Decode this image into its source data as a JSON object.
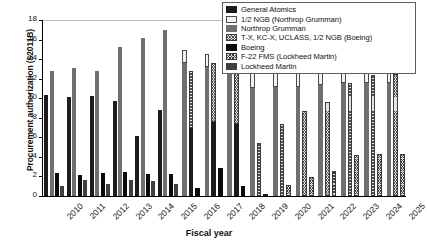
{
  "chart_data": {
    "type": "bar",
    "title": "",
    "xlabel": "Fiscal year",
    "ylabel": "Procurement authorization ($2011B)",
    "ylim": [
      0,
      18
    ],
    "yticks": [
      0,
      2,
      4,
      6,
      8,
      10,
      12,
      14,
      16,
      18
    ],
    "grid": false,
    "legend_position": "top-right",
    "categories": [
      "2010",
      "2011",
      "2012",
      "2013",
      "2014",
      "2015",
      "2016",
      "2017",
      "2018",
      "2019",
      "2020",
      "2021",
      "2022",
      "2023",
      "2024",
      "2025"
    ],
    "series": [
      {
        "name": "General Atomics",
        "key": "general_atomics",
        "fill": "solid-dark",
        "values": [
          10.3,
          10.1,
          10.2,
          9.7,
          6.1,
          8.8,
          7.0,
          7.6,
          7.4,
          0.2,
          0.0,
          0.0,
          0.0,
          0.0,
          0.0,
          0.0
        ]
      },
      {
        "name": "1/2 NGB (Northrop Grumman)",
        "key": "half_ngb_northrop",
        "fill": "dotted-light",
        "values": [
          0.0,
          0.0,
          0.0,
          0.0,
          0.0,
          0.0,
          1.3,
          1.3,
          1.4,
          1.6,
          1.7,
          1.7,
          1.7,
          1.7,
          1.6,
          1.6
        ]
      },
      {
        "name": "Northrop Grumman",
        "key": "northrop_grumman",
        "fill": "solid-gray",
        "values": [
          12.8,
          13.1,
          12.8,
          15.2,
          16.2,
          17.0,
          13.6,
          13.2,
          12.9,
          11.0,
          11.1,
          11.2,
          11.4,
          11.6,
          11.6,
          11.6
        ]
      },
      {
        "name": "T-X, KC-X, UCLASS, 1/2 NGB (Boeing)",
        "key": "boeing_programs",
        "fill": "crosshatch-light",
        "values": [
          0.0,
          0.0,
          0.0,
          0.0,
          0.0,
          0.0,
          5.8,
          6.0,
          5.8,
          5.4,
          7.4,
          8.7,
          9.6,
          11.6,
          12.4,
          12.5
        ]
      },
      {
        "name": "Boeing",
        "key": "boeing",
        "fill": "solid-black",
        "values": [
          2.4,
          2.1,
          2.4,
          2.5,
          2.3,
          2.3,
          0.8,
          2.9,
          1.0,
          0.0,
          0.0,
          0.0,
          0.0,
          0.0,
          0.0,
          0.0
        ]
      },
      {
        "name": "F-22 FMS (Lockheed Martin)",
        "key": "f22_fms_lockheed",
        "fill": "hatch-light",
        "values": [
          0.0,
          0.0,
          0.0,
          0.0,
          0.0,
          0.0,
          0.0,
          0.0,
          0.0,
          0.0,
          1.1,
          1.9,
          2.6,
          4.2,
          4.3,
          4.3
        ]
      },
      {
        "name": "Lockheed Martin",
        "key": "lockheed_martin",
        "fill": "solid-darkgray",
        "values": [
          1.0,
          1.6,
          1.2,
          1.6,
          1.5,
          1.2,
          0.0,
          0.0,
          0.0,
          0.0,
          0.0,
          0.0,
          0.0,
          0.0,
          0.0,
          0.0
        ]
      }
    ],
    "stacks": {
      "note": "Bars 2016-2025 are two-segment stacks: a solid lower segment with a patterned upper segment.",
      "column_stacks": [
        {
          "year": "2016",
          "bars": [
            {
              "segments": [
                {
                  "series": "Northrop Grumman",
                  "value": 13.6
                },
                {
                  "series": "1/2 NGB (Northrop Grumman)",
                  "value": 1.3
                }
              ]
            },
            {
              "segments": [
                {
                  "series": "General Atomics",
                  "value": 7.0
                },
                {
                  "series": "T-X, KC-X, UCLASS, 1/2 NGB (Boeing)",
                  "value": 5.8
                }
              ]
            },
            {
              "segments": [
                {
                  "series": "Boeing",
                  "value": 0.8
                }
              ]
            }
          ]
        },
        {
          "year": "2017",
          "bars": [
            {
              "segments": [
                {
                  "series": "Northrop Grumman",
                  "value": 13.2
                },
                {
                  "series": "1/2 NGB (Northrop Grumman)",
                  "value": 1.3
                }
              ]
            },
            {
              "segments": [
                {
                  "series": "General Atomics",
                  "value": 7.6
                },
                {
                  "series": "T-X, KC-X, UCLASS, 1/2 NGB (Boeing)",
                  "value": 6.0
                }
              ]
            },
            {
              "segments": [
                {
                  "series": "Boeing",
                  "value": 2.9
                }
              ]
            }
          ]
        },
        {
          "year": "2018",
          "bars": [
            {
              "segments": [
                {
                  "series": "Northrop Grumman",
                  "value": 12.9
                },
                {
                  "series": "1/2 NGB (Northrop Grumman)",
                  "value": 1.4
                }
              ]
            },
            {
              "segments": [
                {
                  "series": "General Atomics",
                  "value": 7.4
                },
                {
                  "series": "T-X, KC-X, UCLASS, 1/2 NGB (Boeing)",
                  "value": 5.8
                }
              ]
            },
            {
              "segments": [
                {
                  "series": "Boeing",
                  "value": 1.0
                }
              ]
            }
          ]
        },
        {
          "year": "2019",
          "bars": [
            {
              "segments": [
                {
                  "series": "Northrop Grumman",
                  "value": 11.0
                },
                {
                  "series": "1/2 NGB (Northrop Grumman)",
                  "value": 1.6
                }
              ]
            },
            {
              "segments": [
                {
                  "series": "T-X, KC-X, UCLASS, 1/2 NGB (Boeing)",
                  "value": 5.4
                }
              ]
            },
            {
              "segments": [
                {
                  "series": "General Atomics",
                  "value": 0.2
                }
              ]
            }
          ]
        },
        {
          "year": "2020",
          "bars": [
            {
              "segments": [
                {
                  "series": "Northrop Grumman",
                  "value": 11.1
                },
                {
                  "series": "1/2 NGB (Northrop Grumman)",
                  "value": 1.7
                }
              ]
            },
            {
              "segments": [
                {
                  "series": "T-X, KC-X, UCLASS, 1/2 NGB (Boeing)",
                  "value": 7.4
                }
              ]
            },
            {
              "segments": [
                {
                  "series": "F-22 FMS (Lockheed Martin)",
                  "value": 1.1
                }
              ]
            }
          ]
        },
        {
          "year": "2021",
          "bars": [
            {
              "segments": [
                {
                  "series": "Northrop Grumman",
                  "value": 11.2
                },
                {
                  "series": "1/2 NGB (Northrop Grumman)",
                  "value": 1.7
                }
              ]
            },
            {
              "segments": [
                {
                  "series": "T-X, KC-X, UCLASS, 1/2 NGB (Boeing)",
                  "value": 8.7
                }
              ]
            },
            {
              "segments": [
                {
                  "series": "F-22 FMS (Lockheed Martin)",
                  "value": 1.9
                }
              ]
            }
          ]
        },
        {
          "year": "2022",
          "bars": [
            {
              "segments": [
                {
                  "series": "Northrop Grumman",
                  "value": 11.4
                },
                {
                  "series": "1/2 NGB (Northrop Grumman)",
                  "value": 1.7
                }
              ]
            },
            {
              "segments": [
                {
                  "series": "T-X, KC-X, UCLASS, 1/2 NGB (Boeing)",
                  "value": 9.6
                }
              ]
            },
            {
              "segments": [
                {
                  "series": "F-22 FMS (Lockheed Martin)",
                  "value": 2.6
                }
              ]
            }
          ]
        },
        {
          "year": "2023",
          "bars": [
            {
              "segments": [
                {
                  "series": "Northrop Grumman",
                  "value": 11.6
                },
                {
                  "series": "1/2 NGB (Northrop Grumman)",
                  "value": 1.7
                }
              ]
            },
            {
              "segments": [
                {
                  "series": "T-X, KC-X, UCLASS, 1/2 NGB (Boeing)",
                  "value": 11.6
                }
              ]
            },
            {
              "segments": [
                {
                  "series": "F-22 FMS (Lockheed Martin)",
                  "value": 4.2
                }
              ]
            }
          ]
        },
        {
          "year": "2024",
          "bars": [
            {
              "segments": [
                {
                  "series": "Northrop Grumman",
                  "value": 11.6
                },
                {
                  "series": "1/2 NGB (Northrop Grumman)",
                  "value": 1.6
                }
              ]
            },
            {
              "segments": [
                {
                  "series": "T-X, KC-X, UCLASS, 1/2 NGB (Boeing)",
                  "value": 12.4
                }
              ]
            },
            {
              "segments": [
                {
                  "series": "F-22 FMS (Lockheed Martin)",
                  "value": 4.3
                }
              ]
            }
          ]
        },
        {
          "year": "2025",
          "bars": [
            {
              "segments": [
                {
                  "series": "Northrop Grumman",
                  "value": 11.6
                },
                {
                  "series": "1/2 NGB (Northrop Grumman)",
                  "value": 1.6
                }
              ]
            },
            {
              "segments": [
                {
                  "series": "T-X, KC-X, UCLASS, 1/2 NGB (Boeing)",
                  "value": 12.5
                }
              ]
            },
            {
              "segments": [
                {
                  "series": "F-22 FMS (Lockheed Martin)",
                  "value": 4.3
                }
              ]
            }
          ]
        }
      ]
    },
    "columns": [
      {
        "year": "2010",
        "bars": [
          [
            {
              "s": 0,
              "v": 10.3
            }
          ],
          [
            {
              "s": 2,
              "v": 12.8
            }
          ],
          [
            {
              "s": 4,
              "v": 2.4
            }
          ],
          [
            {
              "s": 6,
              "v": 1.0
            }
          ]
        ]
      },
      {
        "year": "2011",
        "bars": [
          [
            {
              "s": 0,
              "v": 10.1
            }
          ],
          [
            {
              "s": 2,
              "v": 13.1
            }
          ],
          [
            {
              "s": 4,
              "v": 2.1
            }
          ],
          [
            {
              "s": 6,
              "v": 1.6
            }
          ]
        ]
      },
      {
        "year": "2012",
        "bars": [
          [
            {
              "s": 0,
              "v": 10.2
            }
          ],
          [
            {
              "s": 2,
              "v": 12.8
            }
          ],
          [
            {
              "s": 4,
              "v": 2.4
            }
          ],
          [
            {
              "s": 6,
              "v": 1.2
            }
          ]
        ]
      },
      {
        "year": "2013",
        "bars": [
          [
            {
              "s": 0,
              "v": 9.7
            }
          ],
          [
            {
              "s": 2,
              "v": 15.2
            }
          ],
          [
            {
              "s": 4,
              "v": 2.5
            }
          ],
          [
            {
              "s": 6,
              "v": 1.6
            }
          ]
        ]
      },
      {
        "year": "2014",
        "bars": [
          [
            {
              "s": 0,
              "v": 6.1
            }
          ],
          [
            {
              "s": 2,
              "v": 16.2
            }
          ],
          [
            {
              "s": 4,
              "v": 2.3
            }
          ],
          [
            {
              "s": 6,
              "v": 1.5
            }
          ]
        ]
      },
      {
        "year": "2015",
        "bars": [
          [
            {
              "s": 0,
              "v": 8.8
            }
          ],
          [
            {
              "s": 2,
              "v": 17.0
            }
          ],
          [
            {
              "s": 4,
              "v": 2.3
            }
          ],
          [
            {
              "s": 6,
              "v": 1.2
            }
          ]
        ]
      },
      {
        "year": "2016",
        "bars": [
          [
            {
              "s": 2,
              "v": 13.6
            },
            {
              "s": 1,
              "v": 1.3
            }
          ],
          [
            {
              "s": 0,
              "v": 7.0
            },
            {
              "s": 3,
              "v": 5.8
            }
          ],
          [
            {
              "s": 4,
              "v": 0.8
            }
          ]
        ]
      },
      {
        "year": "2017",
        "bars": [
          [
            {
              "s": 2,
              "v": 13.2
            },
            {
              "s": 1,
              "v": 1.3
            }
          ],
          [
            {
              "s": 0,
              "v": 7.6
            },
            {
              "s": 3,
              "v": 6.0
            }
          ],
          [
            {
              "s": 4,
              "v": 2.9
            }
          ]
        ]
      },
      {
        "year": "2018",
        "bars": [
          [
            {
              "s": 2,
              "v": 12.9
            },
            {
              "s": 1,
              "v": 1.4
            }
          ],
          [
            {
              "s": 0,
              "v": 7.4
            },
            {
              "s": 3,
              "v": 5.8
            }
          ],
          [
            {
              "s": 4,
              "v": 1.0
            }
          ]
        ]
      },
      {
        "year": "2019",
        "bars": [
          [
            {
              "s": 2,
              "v": 11.0
            },
            {
              "s": 1,
              "v": 1.6
            }
          ],
          [
            {
              "s": 3,
              "v": 5.4
            }
          ],
          [
            {
              "s": 0,
              "v": 0.2
            }
          ]
        ]
      },
      {
        "year": "2020",
        "bars": [
          [
            {
              "s": 2,
              "v": 11.1
            },
            {
              "s": 1,
              "v": 1.7
            }
          ],
          [
            {
              "s": 3,
              "v": 7.4
            }
          ],
          [
            {
              "s": 5,
              "v": 1.1
            }
          ]
        ]
      },
      {
        "year": "2021",
        "bars": [
          [
            {
              "s": 2,
              "v": 11.2
            },
            {
              "s": 1,
              "v": 1.7
            }
          ],
          [
            {
              "s": 3,
              "v": 8.7
            }
          ],
          [
            {
              "s": 5,
              "v": 1.9
            }
          ]
        ]
      },
      {
        "year": "2022",
        "bars": [
          [
            {
              "s": 2,
              "v": 11.4
            },
            {
              "s": 1,
              "v": 1.7
            }
          ],
          [
            {
              "s": 3,
              "v": 9.6
            }
          ],
          [
            {
              "s": 5,
              "v": 2.6
            }
          ]
        ]
      },
      {
        "year": "2023",
        "bars": [
          [
            {
              "s": 2,
              "v": 11.6
            },
            {
              "s": 1,
              "v": 1.7
            }
          ],
          [
            {
              "s": 3,
              "v": 11.6
            }
          ],
          [
            {
              "s": 5,
              "v": 4.2
            }
          ]
        ]
      },
      {
        "year": "2024",
        "bars": [
          [
            {
              "s": 2,
              "v": 11.6
            },
            {
              "s": 1,
              "v": 1.6
            }
          ],
          [
            {
              "s": 3,
              "v": 12.4
            }
          ],
          [
            {
              "s": 5,
              "v": 4.3
            }
          ]
        ]
      },
      {
        "year": "2025",
        "bars": [
          [
            {
              "s": 2,
              "v": 11.6
            },
            {
              "s": 1,
              "v": 1.6
            }
          ],
          [
            {
              "s": 3,
              "v": 12.5
            }
          ],
          [
            {
              "s": 5,
              "v": 4.3
            }
          ]
        ]
      }
    ]
  },
  "legend": {
    "items": [
      {
        "label": "General Atomics",
        "fill": "f-ga"
      },
      {
        "label": "1/2 NGB (Northrop Grumman)",
        "fill": "f-halfngb"
      },
      {
        "label": "Northrop Grumman",
        "fill": "f-ng"
      },
      {
        "label": "T-X, KC-X, UCLASS, 1/2 NGB (Boeing)",
        "fill": "f-boe2"
      },
      {
        "label": "Boeing",
        "fill": "f-boe"
      },
      {
        "label": "F-22 FMS (Lockheed Martin)",
        "fill": "f-f22"
      },
      {
        "label": "Lockheed Martin",
        "fill": "f-lm"
      }
    ]
  }
}
